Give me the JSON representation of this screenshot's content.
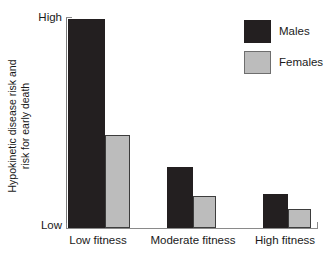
{
  "chart_data": {
    "type": "bar",
    "title": "",
    "subtitle": "",
    "xlabel": "",
    "ylabel_lines": [
      "Hypokinetic disease risk and",
      "risk for early death"
    ],
    "ylabel": "Hypokinetic disease risk and risk for early death",
    "categories": [
      "Low fitness",
      "Moderate fitness",
      "High fitness"
    ],
    "ytick_labels": [
      "High",
      "Low"
    ],
    "ylim": [
      0,
      100
    ],
    "ylim_labels": {
      "min": "Low",
      "max": "High"
    },
    "grid": false,
    "legend_position": "top-right",
    "series": [
      {
        "name": "Males",
        "color": "#231f20",
        "values": [
          99,
          29,
          16
        ]
      },
      {
        "name": "Females",
        "color": "#bcbcbc",
        "values": [
          44,
          15,
          9
        ]
      }
    ],
    "annotations": []
  },
  "axes": {
    "y_tick_high": "High",
    "y_tick_low": "Low"
  },
  "legend": {
    "items": [
      {
        "label": "Males",
        "swatch": "males-swatch"
      },
      {
        "label": "Females",
        "swatch": "females-swatch"
      }
    ]
  },
  "colors": {
    "males": "#231f20",
    "females": "#bcbcbc",
    "females_border": "#3d3d3d",
    "axis": "#8a8a8a",
    "text": "#1a1a1a",
    "background": "#ffffff"
  }
}
